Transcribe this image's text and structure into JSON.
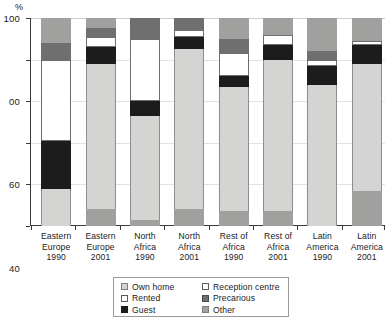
{
  "chart_data": {
    "type": "bar",
    "subtype": "stacked-bar-100",
    "title": "",
    "xlabel": "",
    "ylabel": "%",
    "ylim": [
      0,
      100
    ],
    "yticks": [
      0,
      20,
      40,
      60,
      80,
      100
    ],
    "ytick_labels": [
      "0",
      "20",
      "40",
      "60",
      "00",
      "100"
    ],
    "grid": true,
    "legend_position": "bottom-center",
    "categories": [
      "Eastern Europe 1990",
      "Eastern Europe 2001",
      "North Africa 1990",
      "North Africa 2001",
      "Rest of Africa 1990",
      "Rest of Africa 2001",
      "Latin America 1990",
      "Latin America 2001"
    ],
    "category_lines": [
      [
        "Eastern",
        "Europe",
        "1990"
      ],
      [
        "Eastern",
        "Europe",
        "2001"
      ],
      [
        "North",
        "Africa",
        "1990"
      ],
      [
        "North",
        "Africa",
        "2001"
      ],
      [
        "Rest of",
        "Africa",
        "1990"
      ],
      [
        "Rest of",
        "Africa",
        "2001"
      ],
      [
        "Latin",
        "America",
        "1990"
      ],
      [
        "Latin",
        "America",
        "2001"
      ]
    ],
    "series": [
      {
        "name": "Own home",
        "key": "own",
        "color": "#d4d4d2",
        "values": [
          18,
          70,
          50,
          77,
          60,
          73,
          68,
          61
        ]
      },
      {
        "name": "Guest",
        "key": "guest",
        "color": "#1c1c1c",
        "values": [
          23,
          8,
          7,
          6,
          5,
          7,
          9,
          9
        ]
      },
      {
        "name": "Rented",
        "key": "rented",
        "color": "#ffffff",
        "values": [
          39,
          5,
          30,
          3,
          11,
          5,
          3,
          2
        ]
      },
      {
        "name": "Reception centre",
        "key": "reception",
        "color": "#ffffff",
        "values": [
          0,
          0,
          0,
          0,
          0,
          0,
          0,
          0
        ]
      },
      {
        "name": "Precarious",
        "key": "precar",
        "color": "#6f6f6f",
        "values": [
          8,
          4,
          10,
          6,
          7,
          0,
          4,
          0
        ]
      },
      {
        "name": "Other",
        "key": "other",
        "color": "#a0a09e",
        "values": [
          12,
          13,
          3,
          8,
          17,
          15,
          16,
          28
        ]
      }
    ],
    "stacks": [
      {
        "category": "Eastern Europe 1990",
        "segments": [
          {
            "key": "other",
            "name": "Other",
            "from": 0,
            "to": 0
          },
          {
            "key": "own",
            "name": "Own home",
            "from": 0,
            "to": 18
          },
          {
            "key": "guest",
            "name": "Guest",
            "from": 18,
            "to": 41
          },
          {
            "key": "rented",
            "name": "Rented",
            "from": 41,
            "to": 80
          },
          {
            "key": "precar",
            "name": "Precarious",
            "from": 80,
            "to": 88
          },
          {
            "key": "other2",
            "name": "Other",
            "from": 88,
            "to": 100
          }
        ]
      },
      {
        "category": "Eastern Europe 2001",
        "segments": [
          {
            "key": "other",
            "name": "Other",
            "from": 0,
            "to": 8
          },
          {
            "key": "own",
            "name": "Own home",
            "from": 8,
            "to": 78
          },
          {
            "key": "guest",
            "name": "Guest",
            "from": 78,
            "to": 86
          },
          {
            "key": "rented",
            "name": "Rented",
            "from": 86,
            "to": 91
          },
          {
            "key": "precar",
            "name": "Precarious",
            "from": 91,
            "to": 95
          },
          {
            "key": "other2",
            "name": "Other",
            "from": 95,
            "to": 100
          }
        ]
      },
      {
        "category": "North Africa 1990",
        "segments": [
          {
            "key": "other",
            "name": "Other",
            "from": 0,
            "to": 3
          },
          {
            "key": "own",
            "name": "Own home",
            "from": 3,
            "to": 53
          },
          {
            "key": "guest",
            "name": "Guest",
            "from": 53,
            "to": 60
          },
          {
            "key": "rented",
            "name": "Rented",
            "from": 60,
            "to": 90
          },
          {
            "key": "precar",
            "name": "Precarious",
            "from": 90,
            "to": 100
          },
          {
            "key": "other2",
            "name": "Other",
            "from": 100,
            "to": 100
          }
        ]
      },
      {
        "category": "North Africa 2001",
        "segments": [
          {
            "key": "other",
            "name": "Other",
            "from": 0,
            "to": 8
          },
          {
            "key": "own",
            "name": "Own home",
            "from": 8,
            "to": 85
          },
          {
            "key": "guest",
            "name": "Guest",
            "from": 85,
            "to": 91
          },
          {
            "key": "rented",
            "name": "Rented",
            "from": 91,
            "to": 94
          },
          {
            "key": "precar",
            "name": "Precarious",
            "from": 94,
            "to": 100
          },
          {
            "key": "other2",
            "name": "Other",
            "from": 100,
            "to": 100
          }
        ]
      },
      {
        "category": "Rest of Africa 1990",
        "segments": [
          {
            "key": "other",
            "name": "Other",
            "from": 0,
            "to": 7
          },
          {
            "key": "own",
            "name": "Own home",
            "from": 7,
            "to": 67
          },
          {
            "key": "guest",
            "name": "Guest",
            "from": 67,
            "to": 72
          },
          {
            "key": "rented",
            "name": "Rented",
            "from": 72,
            "to": 83
          },
          {
            "key": "precar",
            "name": "Precarious",
            "from": 83,
            "to": 90
          },
          {
            "key": "other2",
            "name": "Other",
            "from": 90,
            "to": 100
          }
        ]
      },
      {
        "category": "Rest of Africa 2001",
        "segments": [
          {
            "key": "other",
            "name": "Other",
            "from": 0,
            "to": 7
          },
          {
            "key": "own",
            "name": "Own home",
            "from": 7,
            "to": 80
          },
          {
            "key": "guest",
            "name": "Guest",
            "from": 80,
            "to": 87
          },
          {
            "key": "rented",
            "name": "Rented",
            "from": 87,
            "to": 92
          },
          {
            "key": "precar",
            "name": "Precarious",
            "from": 92,
            "to": 92
          },
          {
            "key": "other2",
            "name": "Other",
            "from": 92,
            "to": 100
          }
        ]
      },
      {
        "category": "Latin America 1990",
        "segments": [
          {
            "key": "other",
            "name": "Other",
            "from": 0,
            "to": 0
          },
          {
            "key": "own",
            "name": "Own home",
            "from": 0,
            "to": 68
          },
          {
            "key": "guest",
            "name": "Guest",
            "from": 68,
            "to": 77
          },
          {
            "key": "rented",
            "name": "Rented",
            "from": 77,
            "to": 80
          },
          {
            "key": "precar",
            "name": "Precarious",
            "from": 80,
            "to": 84
          },
          {
            "key": "other2",
            "name": "Other",
            "from": 84,
            "to": 100
          }
        ]
      },
      {
        "category": "Latin America 2001",
        "segments": [
          {
            "key": "other",
            "name": "Other",
            "from": 0,
            "to": 17
          },
          {
            "key": "own",
            "name": "Own home",
            "from": 17,
            "to": 78
          },
          {
            "key": "guest",
            "name": "Guest",
            "from": 78,
            "to": 87
          },
          {
            "key": "rented",
            "name": "Rented",
            "from": 87,
            "to": 89
          },
          {
            "key": "precar",
            "name": "Precarious",
            "from": 89,
            "to": 89
          },
          {
            "key": "other2",
            "name": "Other",
            "from": 89,
            "to": 100
          }
        ]
      }
    ],
    "legend": [
      {
        "label": "Own home",
        "swatch": "sw-own",
        "color": "#d4d4d2"
      },
      {
        "label": "Rented",
        "swatch": "sw-rented",
        "color": "#ffffff"
      },
      {
        "label": "Guest",
        "swatch": "sw-guest",
        "color": "#1c1c1c"
      },
      {
        "label": "Reception centre",
        "swatch": "sw-reception",
        "color": "#ffffff"
      },
      {
        "label": "Precarious",
        "swatch": "sw-precar",
        "color": "#6f6f6f"
      },
      {
        "label": "Other",
        "swatch": "sw-other",
        "color": "#a0a09e"
      }
    ]
  }
}
